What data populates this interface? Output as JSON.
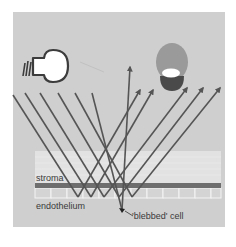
{
  "diagram": {
    "colors": {
      "background": "#ffffff",
      "panel": "#cfcfcf",
      "ray": "#555555",
      "stroma_band": "#6e6e6e",
      "stroma_region": "#e2e2e2",
      "cell_outline": "#f2f2f2",
      "bulb_fill": "#ffffff",
      "bulb_outline": "#3c3c3c",
      "eye_upper": "#9a9a9a",
      "eye_lower": "#4a4a4a",
      "eye_highlight": "#ffffff"
    },
    "labels": {
      "stroma": "stroma",
      "endothelium": "endothelium",
      "blebbed_cell": "'blebbed' cell"
    },
    "icons": {
      "light_source": "light-bulb-icon",
      "observer": "eye-icon"
    },
    "incident_ray_count": 6,
    "reflected_ray_count": 6
  }
}
